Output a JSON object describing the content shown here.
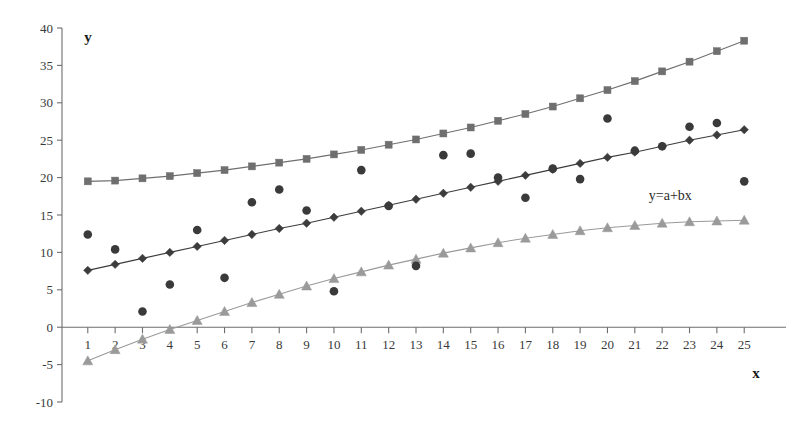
{
  "chart_data": {
    "type": "scatter",
    "title": "",
    "subtitle": "",
    "xlabel": "x",
    "ylabel": "y",
    "xlim": [
      0.35,
      25.65
    ],
    "ylim": [
      -10,
      40
    ],
    "grid": false,
    "legend_position": "none",
    "x_ticks": [
      1,
      2,
      3,
      4,
      5,
      6,
      7,
      8,
      9,
      10,
      11,
      12,
      13,
      14,
      15,
      16,
      17,
      18,
      19,
      20,
      21,
      22,
      23,
      24,
      25
    ],
    "y_ticks": [
      -10,
      -5,
      0,
      5,
      10,
      15,
      20,
      25,
      30,
      35,
      40
    ],
    "x_tick_labels": [
      "1",
      "2",
      "3",
      "4",
      "5",
      "6",
      "7",
      "8",
      "9",
      "10",
      "11",
      "12",
      "13",
      "14",
      "15",
      "16",
      "17",
      "18",
      "19",
      "20",
      "21",
      "22",
      "23",
      "24",
      "25"
    ],
    "y_tick_labels": [
      "-10",
      "-5",
      "0",
      "5",
      "10",
      "15",
      "20",
      "25",
      "30",
      "35",
      "40"
    ],
    "annotations": [
      {
        "text": "y=a+bx",
        "x": 22.3,
        "y": 17.0
      }
    ],
    "x": [
      1,
      2,
      3,
      4,
      5,
      6,
      7,
      8,
      9,
      10,
      11,
      12,
      13,
      14,
      15,
      16,
      17,
      18,
      19,
      20,
      21,
      22,
      23,
      24,
      25
    ],
    "series": [
      {
        "name": "upper-fit",
        "marker": "square",
        "color": "#6f6f6f",
        "line": true,
        "values": [
          19.5,
          19.6,
          19.9,
          20.2,
          20.6,
          21.0,
          21.5,
          22.0,
          22.5,
          23.1,
          23.7,
          24.4,
          25.1,
          25.9,
          26.7,
          27.6,
          28.5,
          29.5,
          30.6,
          31.7,
          32.9,
          34.2,
          35.5,
          36.9,
          38.3
        ]
      },
      {
        "name": "middle-fit",
        "marker": "diamond",
        "color": "#3c3c3c",
        "line": true,
        "values": [
          7.6,
          8.4,
          9.2,
          10.0,
          10.8,
          11.6,
          12.4,
          13.2,
          13.9,
          14.7,
          15.5,
          16.3,
          17.1,
          17.9,
          18.7,
          19.5,
          20.3,
          21.1,
          21.9,
          22.7,
          23.4,
          24.2,
          25.0,
          25.7,
          26.4
        ]
      },
      {
        "name": "lower-fit",
        "marker": "triangle",
        "color": "#9a9a9a",
        "line": true,
        "values": [
          -4.5,
          -3.0,
          -1.6,
          -0.3,
          0.9,
          2.1,
          3.3,
          4.4,
          5.5,
          6.5,
          7.4,
          8.3,
          9.1,
          9.9,
          10.6,
          11.3,
          11.9,
          12.4,
          12.9,
          13.3,
          13.6,
          13.9,
          14.1,
          14.2,
          14.3
        ]
      },
      {
        "name": "observations",
        "marker": "circle",
        "color": "#3a3a3a",
        "line": false,
        "values": [
          12.4,
          10.4,
          2.1,
          5.7,
          13.0,
          6.6,
          16.7,
          18.4,
          15.6,
          4.8,
          21.0,
          16.2,
          8.2,
          23.0,
          23.2,
          20.0,
          17.3,
          21.2,
          19.8,
          27.9,
          23.6,
          24.2,
          26.8,
          27.3,
          19.5
        ]
      }
    ]
  },
  "labels": {
    "y_axis_name": "y",
    "x_axis_name": "x"
  }
}
